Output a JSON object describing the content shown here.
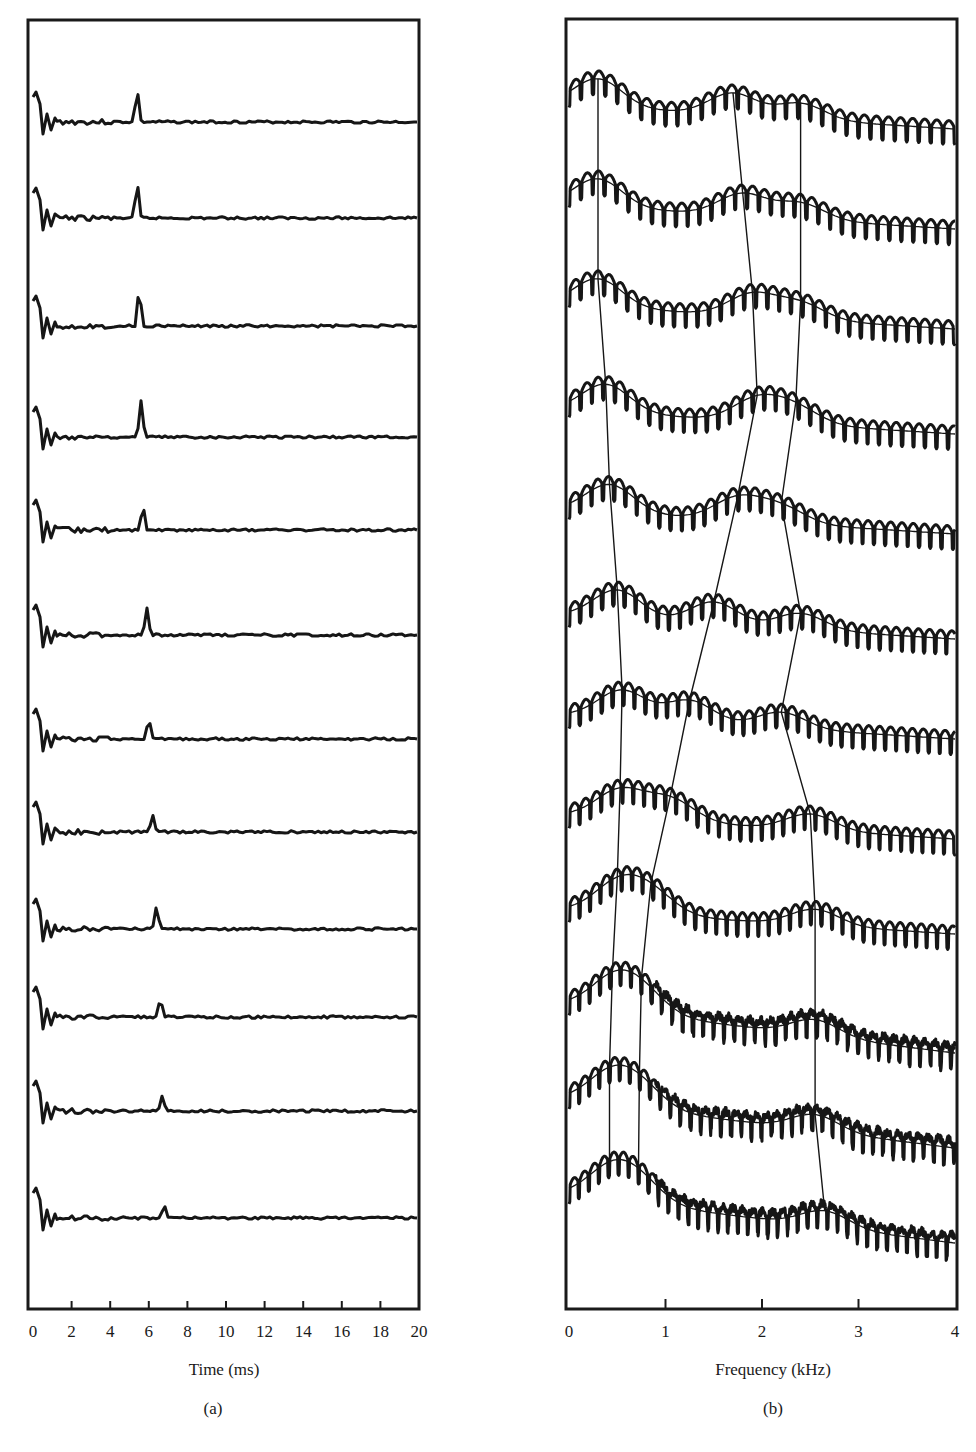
{
  "figure": {
    "panels": [
      {
        "id": "a",
        "label": "(a)",
        "xlabel": "Time (ms)",
        "xticks": [
          "0",
          "2",
          "4",
          "6",
          "8",
          "10",
          "12",
          "14",
          "16",
          "18",
          "20"
        ]
      },
      {
        "id": "b",
        "label": "(b)",
        "xlabel": "Frequency (kHz)",
        "xticks": [
          "0",
          "1",
          "2",
          "3",
          "4"
        ]
      }
    ]
  },
  "chart_data": [
    {
      "type": "line",
      "title": "(a)",
      "xlabel": "Time (ms)",
      "ylabel": "",
      "xlim": [
        0,
        20
      ],
      "grid": false,
      "legend": "none",
      "description": "Stacked sequence of 12 time-domain waveforms (top to bottom); each shows an initial transient near 0 ms and a single pulse whose position drifts later over the sequence.",
      "series": [
        {
          "name": "trace 1",
          "pulse_time_ms": 5.4
        },
        {
          "name": "trace 2",
          "pulse_time_ms": 5.4
        },
        {
          "name": "trace 3",
          "pulse_time_ms": 5.5
        },
        {
          "name": "trace 4",
          "pulse_time_ms": 5.6
        },
        {
          "name": "trace 5",
          "pulse_time_ms": 5.7
        },
        {
          "name": "trace 6",
          "pulse_time_ms": 5.9
        },
        {
          "name": "trace 7",
          "pulse_time_ms": 6.0
        },
        {
          "name": "trace 8",
          "pulse_time_ms": 6.2
        },
        {
          "name": "trace 9",
          "pulse_time_ms": 6.4
        },
        {
          "name": "trace 10",
          "pulse_time_ms": 6.6
        },
        {
          "name": "trace 11",
          "pulse_time_ms": 6.7
        },
        {
          "name": "trace 12",
          "pulse_time_ms": 6.8
        }
      ]
    },
    {
      "type": "line",
      "title": "(b)",
      "xlabel": "Frequency (kHz)",
      "ylabel": "",
      "xlim": [
        0,
        4
      ],
      "grid": false,
      "legend": "none",
      "description": "Stacked sequence of 12 log-magnitude spectra with harmonic ripple and a smooth spectral envelope overlaid; thin lines connect the formant peaks (F1, F2, F3) across successive spectra.",
      "formant_tracks_khz": {
        "F1": [
          0.3,
          0.3,
          0.3,
          0.38,
          0.42,
          0.5,
          0.55,
          0.53,
          0.5,
          0.45,
          0.42,
          0.42
        ],
        "F2": [
          1.7,
          1.8,
          1.9,
          1.95,
          1.75,
          1.5,
          1.25,
          1.05,
          0.85,
          0.75,
          0.73,
          0.72
        ],
        "F3": [
          2.4,
          2.4,
          2.4,
          2.35,
          2.2,
          2.4,
          2.2,
          2.5,
          2.55,
          2.55,
          2.55,
          2.65
        ]
      }
    }
  ]
}
